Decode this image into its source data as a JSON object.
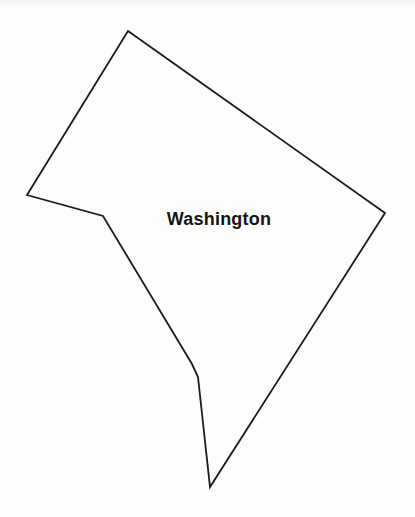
{
  "map": {
    "label": "Washington",
    "label_color": "#141414",
    "label_font_size": 18,
    "label_position": {
      "x": 219,
      "y": 225
    },
    "background_color": "#fdfdfc",
    "outline": {
      "stroke_color": "#1b1b1b",
      "stroke_width": 1.8,
      "fill": "none",
      "points": [
        [
          128,
          31
        ],
        [
          385,
          213
        ],
        [
          210,
          487
        ],
        [
          198,
          377
        ],
        [
          192,
          364
        ],
        [
          103,
          216
        ],
        [
          27,
          195
        ]
      ]
    }
  }
}
